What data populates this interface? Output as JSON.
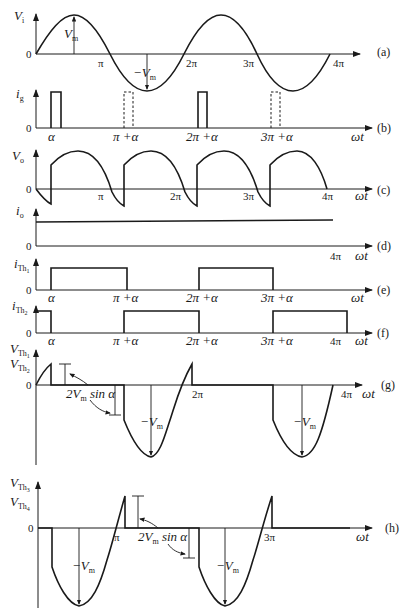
{
  "figure": {
    "panels": [
      {
        "id": "a",
        "tag": "(a)",
        "ylabel": "V",
        "ylabel_sub": "i",
        "ticks": [
          "π",
          "2π",
          "3π",
          "4π"
        ],
        "annotations": [
          "V_m",
          "-V_m"
        ],
        "zero": "0"
      },
      {
        "id": "b",
        "tag": "(b)",
        "ylabel": "i",
        "ylabel_sub": "g",
        "ticks": [
          "α",
          "π +α",
          "2π +α",
          "3π +α"
        ],
        "xlabel": "ωt",
        "zero": "0"
      },
      {
        "id": "c",
        "tag": "(c)",
        "ylabel": "V",
        "ylabel_sub": "o",
        "ticks": [
          "π",
          "2π",
          "3π",
          "4π"
        ],
        "xlabel": "ωt",
        "zero": "0"
      },
      {
        "id": "d",
        "tag": "(d)",
        "ylabel": "i",
        "ylabel_sub": "o",
        "ticks": [
          "4π"
        ],
        "xlabel": "ωt",
        "zero": "0"
      },
      {
        "id": "e",
        "tag": "(e)",
        "ylabel": "i",
        "ylabel_sub": "Th1",
        "ticks": [
          "α",
          "π +α",
          "2π +α",
          "3π +α"
        ],
        "xlabel": "ωt",
        "zero": "0"
      },
      {
        "id": "f",
        "tag": "(f)",
        "ylabel": "i",
        "ylabel_sub": "Th2",
        "ticks": [
          "α",
          "π +α",
          "2π +α",
          "3π +α",
          "4π"
        ],
        "xlabel": "ωt",
        "zero": "0"
      },
      {
        "id": "g",
        "tag": "(g)",
        "ylabel": "V",
        "ylabel_sub": "Th1",
        "ylabel2": "V",
        "ylabel2_sub": "Th2",
        "ticks": [
          "2π",
          "4π"
        ],
        "xlabel": "ωt",
        "annotations": [
          "2V_m sin α",
          "-V_m",
          "-V_m"
        ],
        "zero": "0"
      },
      {
        "id": "h",
        "tag": "(h)",
        "ylabel": "V",
        "ylabel_sub": "Th3",
        "ylabel2": "V",
        "ylabel2_sub": "Th4",
        "ticks": [
          "π",
          "3π"
        ],
        "xlabel": "ωt",
        "annotations": [
          "2V_m sin α",
          "-V_m",
          "-V_m"
        ],
        "zero": "0"
      }
    ]
  },
  "labels": {
    "a_tag": "(a)",
    "b_tag": "(b)",
    "c_tag": "(c)",
    "d_tag": "(d)",
    "e_tag": "(e)",
    "f_tag": "(f)",
    "g_tag": "(g)",
    "h_tag": "(h)",
    "wt": "ωt",
    "zero": "0",
    "pi": "π",
    "two_pi": "2π",
    "three_pi": "3π",
    "four_pi": "4π",
    "alpha": "α",
    "pi_alpha": "π +α",
    "two_pi_alpha": "2π +α",
    "three_pi_alpha": "3π +α",
    "V": "V",
    "i": "i",
    "Vm_V": "V",
    "Vm_sub": "m",
    "neg": "−",
    "sin_alpha": " sin α",
    "two": "2",
    "sub_i": "i",
    "sub_g": "g",
    "sub_o": "o",
    "sub_Th": "Th",
    "one": "1",
    "two_s": "2",
    "three_s": "3",
    "four_s": "4"
  }
}
